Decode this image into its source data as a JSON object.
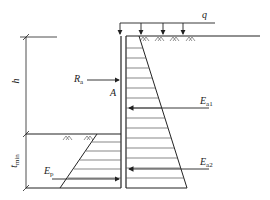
{
  "diagram": {
    "type": "retaining-wall-earth-pressure",
    "labels": {
      "q": "q",
      "h": "h",
      "t_min": "t",
      "t_min_sub": "min",
      "Ra": "R",
      "Ra_sub": "a",
      "A": "A",
      "Ea1": "E",
      "Ea1_sub": "a1",
      "Ea2": "E",
      "Ea2_sub": "a2",
      "Ep": "E",
      "Ep_sub": "p"
    },
    "colors": {
      "line": "#222222",
      "hatch": "#555555",
      "background": "#ffffff"
    }
  }
}
